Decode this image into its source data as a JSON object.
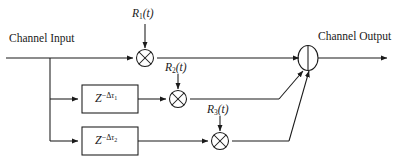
{
  "diagram": {
    "stroke_color": "#1a1a1a",
    "background_color": "#ffffff",
    "labels": {
      "channel_input": "Channel Input",
      "channel_output": "Channel Output",
      "r1": "R",
      "r1_sub": "1",
      "r1_arg": "(t)",
      "r2": "R",
      "r2_sub": "2",
      "r2_arg": "(t)",
      "r3": "R",
      "r3_sub": "3",
      "r3_arg": "(t)",
      "delay1_base": "Z",
      "delay1_exp_sign": "−Δ",
      "delay1_exp_tau": "τ",
      "delay1_exp_sub": "1",
      "delay2_base": "Z",
      "delay2_exp_sign": "−Δ",
      "delay2_exp_tau": "τ",
      "delay2_exp_sub": "2"
    },
    "nodes": {
      "multiplier_1": "multiplier-circle-cross",
      "multiplier_2": "multiplier-circle-cross",
      "multiplier_3": "multiplier-circle-cross",
      "summing_junction": "summing-node-ellipse"
    }
  }
}
